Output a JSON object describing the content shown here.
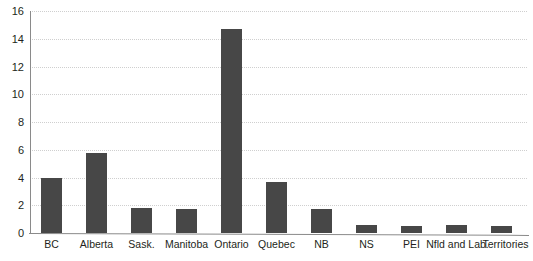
{
  "chart_data": {
    "type": "bar",
    "title": "",
    "subtitle": "",
    "xlabel": "",
    "ylabel": "",
    "ylim": [
      0,
      16
    ],
    "ytick_step": 2,
    "yticks": [
      "16",
      "14",
      "12",
      "10",
      "8",
      "6",
      "4",
      "2",
      "0"
    ],
    "ytick_values": [
      16,
      14,
      12,
      10,
      8,
      6,
      4,
      2,
      0
    ],
    "grid": true,
    "grid_axis": "y",
    "legend": null,
    "legend_position": "none",
    "categories": [
      "BC",
      "Alberta",
      "Sask.",
      "Manitoba",
      "Ontario",
      "Quebec",
      "NB",
      "NS",
      "PEI",
      "Nfld and Lab.",
      "Territories"
    ],
    "values": [
      4.0,
      5.8,
      1.8,
      1.7,
      14.7,
      3.7,
      1.7,
      0.6,
      0.5,
      0.6,
      0.5
    ],
    "bar_color": "#474747",
    "gridline_color": "#cfcfcf",
    "axis_color": "#8a8a8a",
    "background_color": "#ffffff",
    "text_color": "#231f20"
  }
}
